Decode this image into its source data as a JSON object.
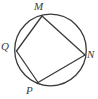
{
  "figure": {
    "type": "geometry-diagram",
    "background_color": "#ffffff",
    "stroke_color": "#3a3a3a",
    "label_color": "#3a3a3a",
    "stroke_width": 1.3,
    "canvas": {
      "width": 98,
      "height": 99
    },
    "circle": {
      "name": "circumscribed-circle",
      "center_x": 50.5,
      "center_y": 50.0,
      "radius": 35.8,
      "filled": false
    },
    "vertices": [
      {
        "id": "M",
        "label": "M",
        "x": 42.0,
        "y": 16.0,
        "label_x": 34,
        "label_y": 1
      },
      {
        "id": "Q",
        "label": "Q",
        "x": 16.5,
        "y": 51.0,
        "label_x": 1,
        "label_y": 41
      },
      {
        "id": "P",
        "label": "P",
        "x": 38.0,
        "y": 82.5,
        "label_x": 26,
        "label_y": 85
      },
      {
        "id": "N",
        "label": "N",
        "x": 85.0,
        "y": 55.0,
        "label_x": 87,
        "label_y": 49
      }
    ],
    "edges": [
      {
        "name": "segment-MQ",
        "from": "M",
        "to": "Q"
      },
      {
        "name": "segment-QP",
        "from": "Q",
        "to": "P"
      },
      {
        "name": "segment-PN",
        "from": "P",
        "to": "N"
      },
      {
        "name": "segment-NM",
        "from": "N",
        "to": "M"
      }
    ],
    "diagonals": []
  }
}
